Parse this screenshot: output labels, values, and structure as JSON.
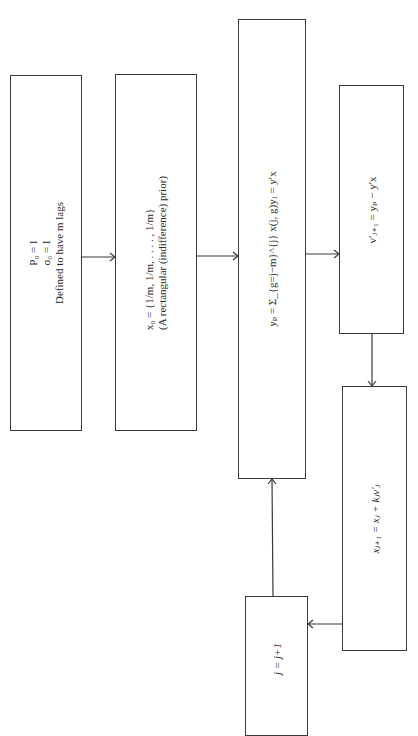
{
  "diagram": {
    "type": "flowchart",
    "orientation": "rotated-90-ccw",
    "nodes": [
      {
        "id": "init",
        "lines": [
          "P₀ = I",
          "σ₀ = I",
          "Defined to have m lags"
        ]
      },
      {
        "id": "prior",
        "lines": [
          "x₀ = {1/m, 1/m, . . . . , 1/m}",
          "(A rectangular (indifference) prior)"
        ]
      },
      {
        "id": "predict",
        "lines": [
          "yₚ = Σ_{g=j−m}^{j} x(j, g)yⱼ = y′x"
        ]
      },
      {
        "id": "error",
        "lines": [
          "v′ⱼ₊₁ = yₚ − y′x"
        ]
      },
      {
        "id": "update",
        "lines": [
          "xⱼ₊₁ = xⱼ + kⱼv′ⱼ"
        ]
      },
      {
        "id": "increment",
        "lines": [
          "j = j+1"
        ]
      }
    ],
    "edges": [
      {
        "from": "init",
        "to": "prior"
      },
      {
        "from": "prior",
        "to": "predict"
      },
      {
        "from": "predict",
        "to": "error"
      },
      {
        "from": "error",
        "to": "update"
      },
      {
        "from": "update",
        "to": "increment"
      },
      {
        "from": "increment",
        "to": "predict"
      }
    ]
  }
}
